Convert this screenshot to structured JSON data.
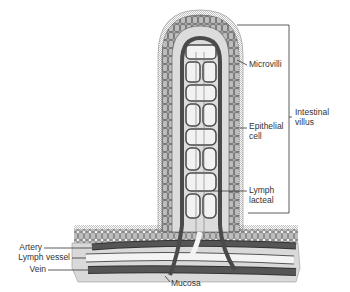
{
  "labels": {
    "microvilli": "Microvilli",
    "epithelial_line1": "Epithelial",
    "epithelial_line2": "cell",
    "lymph_line1": "Lymph",
    "lymph_line2": "lacteal",
    "villus_line1": "Intestinal",
    "villus_line2": "villus",
    "artery": "Artery",
    "lymph_vessel": "Lymph vessel",
    "vein": "Vein",
    "mucosa": "Mucosa"
  },
  "colors": {
    "vessel_dark": "#4a4a4a",
    "vessel_light": "#f4f4f4",
    "tissue": "#d6d6d6",
    "cells": "#9a9a9a",
    "line": "#333333"
  }
}
